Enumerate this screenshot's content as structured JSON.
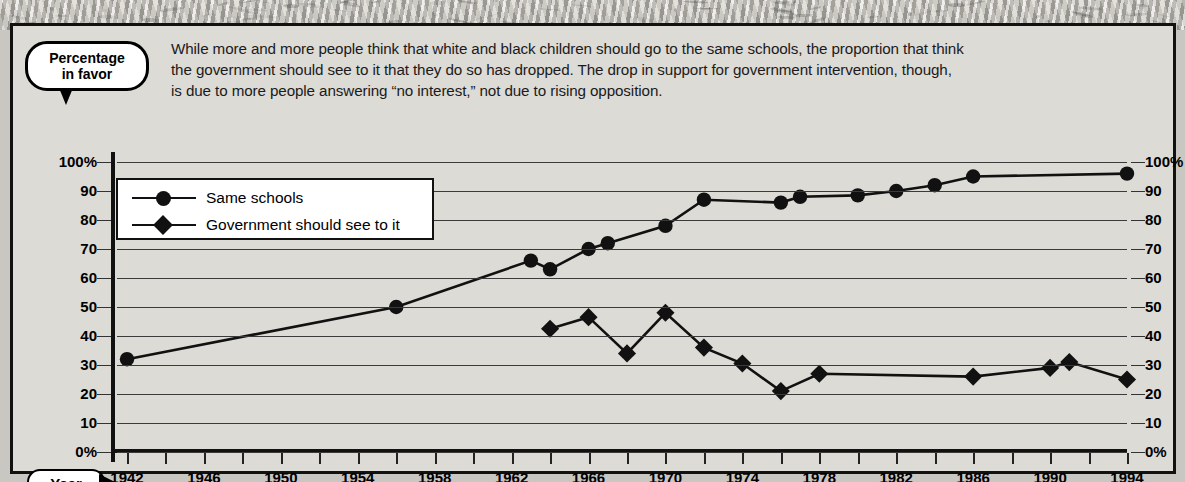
{
  "callout": {
    "line1": "Percentage",
    "line2": "in favor"
  },
  "intro": {
    "line1": "While more and more people think that white and black children should go to the same schools, the proportion that think",
    "line2": "the government should see to it that they do so has dropped. The drop in support for government intervention, though,",
    "line3": "is due to more people answering “no interest,” not due to rising opposition."
  },
  "axis": {
    "year_label": "Year",
    "y_ticks": [
      "100%",
      "90",
      "80",
      "70",
      "60",
      "50",
      "40",
      "30",
      "20",
      "10",
      "0%"
    ],
    "x_labels": [
      "1942",
      "1946",
      "1950",
      "1954",
      "1958",
      "1962",
      "1966",
      "1970",
      "1974",
      "1978",
      "1982",
      "1986",
      "1990",
      "1994"
    ]
  },
  "legend": {
    "items": [
      {
        "label": "Same schools",
        "marker": "circle-marker-icon",
        "color": "#111111"
      },
      {
        "label": "Government should see to it",
        "marker": "diamond-marker-icon",
        "color": "#111111"
      }
    ]
  },
  "colors": {
    "line": "#111111",
    "grid": "#3a3a3a",
    "panel_bg": "#dddbd6",
    "panel_border": "#111111",
    "legend_bg": "#ffffff"
  },
  "chart_data": {
    "type": "line",
    "title": "Percentage in favor",
    "xlabel": "Year",
    "ylabel": "Percentage in favor",
    "xlim": [
      1942,
      1994
    ],
    "ylim": [
      0,
      100
    ],
    "grid": true,
    "legend_position": "upper-left-inside",
    "x_tick_interval_years": 2,
    "x_label_interval_years": 4,
    "y_tick_interval": 10,
    "series": [
      {
        "name": "Same schools",
        "marker": "circle",
        "points": [
          {
            "year": 1942,
            "value": 32
          },
          {
            "year": 1956,
            "value": 50
          },
          {
            "year": 1963,
            "value": 66
          },
          {
            "year": 1964,
            "value": 63
          },
          {
            "year": 1966,
            "value": 70
          },
          {
            "year": 1967,
            "value": 72
          },
          {
            "year": 1970,
            "value": 78
          },
          {
            "year": 1972,
            "value": 87
          },
          {
            "year": 1976,
            "value": 86
          },
          {
            "year": 1977,
            "value": 88
          },
          {
            "year": 1980,
            "value": 88.5
          },
          {
            "year": 1982,
            "value": 90
          },
          {
            "year": 1984,
            "value": 92
          },
          {
            "year": 1986,
            "value": 95
          },
          {
            "year": 1994,
            "value": 96
          }
        ]
      },
      {
        "name": "Government should see to it",
        "marker": "diamond",
        "points": [
          {
            "year": 1964,
            "value": 42.5
          },
          {
            "year": 1966,
            "value": 46.5
          },
          {
            "year": 1968,
            "value": 34
          },
          {
            "year": 1970,
            "value": 48
          },
          {
            "year": 1972,
            "value": 36
          },
          {
            "year": 1974,
            "value": 30.5
          },
          {
            "year": 1976,
            "value": 21
          },
          {
            "year": 1978,
            "value": 27
          },
          {
            "year": 1986,
            "value": 26
          },
          {
            "year": 1990,
            "value": 29
          },
          {
            "year": 1991,
            "value": 31
          },
          {
            "year": 1994,
            "value": 25
          }
        ]
      }
    ]
  }
}
